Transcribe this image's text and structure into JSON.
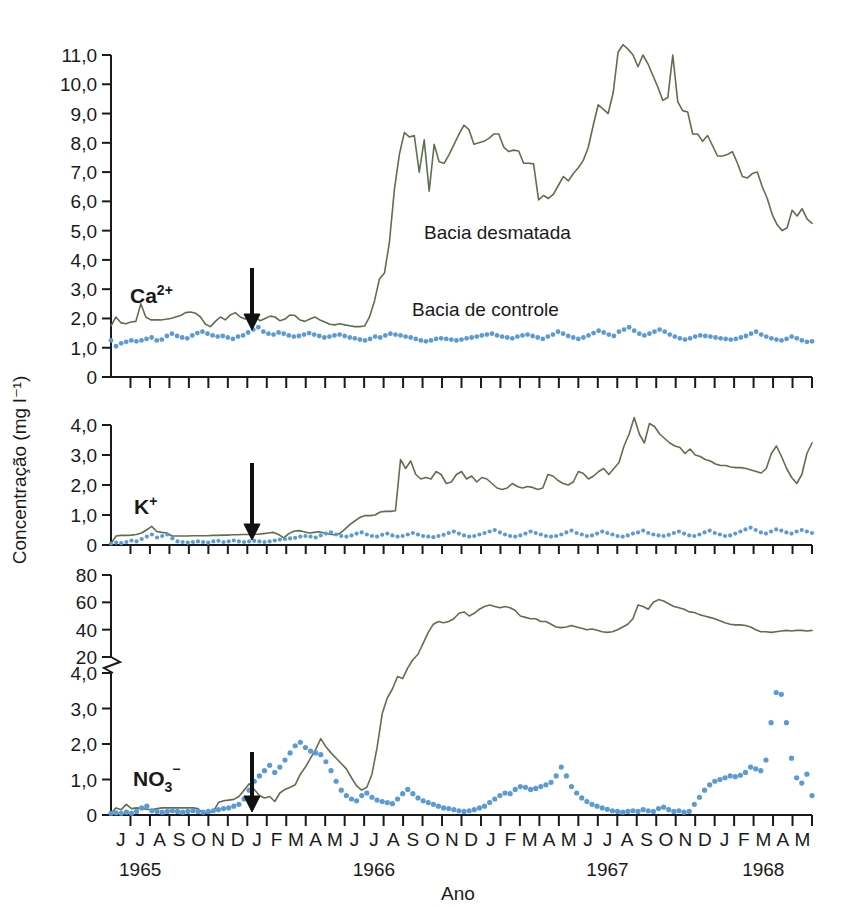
{
  "figure": {
    "y_axis_title": "Concentração (mg l⁻¹)",
    "x_axis_title": "Ano",
    "legend": {
      "treated_label": "Bacia desmatada",
      "control_label": "Bacia de controle"
    },
    "colors": {
      "treated_line": "#5f6f4e",
      "control_dots": "#5b9bd5",
      "axis": "#1a1a1a",
      "arrow": "#111111"
    },
    "months": [
      "J",
      "J",
      "A",
      "S",
      "O",
      "N",
      "D",
      "J",
      "F",
      "M",
      "A",
      "M",
      "J",
      "J",
      "A",
      "S",
      "O",
      "N",
      "D",
      "J",
      "F",
      "M",
      "A",
      "M",
      "J",
      "J",
      "A",
      "S",
      "O",
      "N",
      "D",
      "J",
      "F",
      "M",
      "A",
      "M"
    ],
    "years": [
      {
        "label": "1965",
        "month_index": 1
      },
      {
        "label": "1966",
        "month_index": 13
      },
      {
        "label": "1967",
        "month_index": 25
      },
      {
        "label": "1968",
        "month_index": 33
      }
    ],
    "treatment_arrow_month_index": 8,
    "treatment_arrow_note": "Corte raso / desmatamento"
  },
  "chart_data": [
    {
      "type": "line",
      "title": "Ca2+",
      "panel_label_main": "Ca",
      "panel_label_sup": "2+",
      "ylabel": "Concentração (mg l⁻¹)",
      "xlabel": "Ano",
      "ylim": [
        0,
        11.0
      ],
      "yticks": [
        0,
        1.0,
        2.0,
        3.0,
        4.0,
        5.0,
        6.0,
        7.0,
        8.0,
        9.0,
        10.0,
        11.0
      ],
      "ytick_labels": [
        "0",
        "1,0",
        "2,0",
        "3,0",
        "4,0",
        "5,0",
        "6,0",
        "7,0",
        "8,0",
        "9,0",
        "10,0",
        "11,0"
      ],
      "grid": false,
      "legend_position": "inside-right",
      "series": [
        {
          "name": "Bacia desmatada",
          "style": "solid-line",
          "color": "#5f6f4e",
          "values": [
            1.75,
            2.05,
            1.85,
            1.82,
            1.88,
            1.9,
            2.5,
            2.05,
            1.95,
            1.95,
            1.95,
            1.97,
            2.0,
            2.05,
            2.1,
            2.2,
            2.22,
            2.18,
            2.05,
            1.8,
            1.72,
            1.9,
            2.05,
            1.95,
            2.12,
            2.2,
            2.05,
            1.98,
            2.1,
            2.05,
            1.92,
            2.0,
            2.08,
            2.05,
            1.92,
            1.98,
            2.12,
            2.1,
            1.95,
            1.9,
            1.98,
            2.05,
            1.95,
            1.88,
            1.8,
            1.78,
            1.82,
            1.78,
            1.75,
            1.72,
            1.72,
            1.74,
            2.05,
            2.6,
            3.35,
            3.55,
            4.6,
            6.4,
            7.6,
            8.35,
            8.2,
            8.25,
            7.0,
            8.1,
            6.35,
            7.95,
            7.35,
            7.3,
            7.6,
            7.95,
            8.3,
            8.6,
            8.45,
            7.95,
            8.0,
            8.05,
            8.15,
            8.3,
            8.3,
            7.85,
            7.7,
            7.75,
            7.72,
            7.3,
            7.3,
            7.28,
            6.05,
            6.2,
            6.1,
            6.25,
            6.55,
            6.85,
            6.7,
            6.95,
            7.15,
            7.4,
            7.85,
            8.6,
            9.3,
            9.15,
            9.0,
            9.7,
            11.1,
            11.35,
            11.2,
            11.0,
            10.6,
            11.0,
            10.7,
            10.3,
            9.9,
            9.45,
            9.55,
            11.0,
            9.4,
            9.1,
            9.05,
            8.3,
            8.3,
            8.05,
            8.25,
            7.9,
            7.55,
            7.55,
            7.6,
            7.7,
            7.3,
            6.85,
            6.8,
            6.95,
            7.0,
            6.5,
            6.1,
            5.55,
            5.2,
            5.0,
            5.1,
            5.7,
            5.5,
            5.75,
            5.4,
            5.25
          ]
        },
        {
          "name": "Bacia de controle",
          "style": "dotted",
          "color": "#5b9bd5",
          "values": [
            1.25,
            1.05,
            1.15,
            1.2,
            1.25,
            1.22,
            1.25,
            1.3,
            1.35,
            1.25,
            1.28,
            1.4,
            1.48,
            1.4,
            1.35,
            1.32,
            1.42,
            1.5,
            1.55,
            1.48,
            1.42,
            1.38,
            1.4,
            1.35,
            1.3,
            1.38,
            1.42,
            1.52,
            1.62,
            1.7,
            1.55,
            1.48,
            1.45,
            1.52,
            1.48,
            1.42,
            1.38,
            1.4,
            1.45,
            1.5,
            1.45,
            1.4,
            1.35,
            1.38,
            1.42,
            1.45,
            1.4,
            1.35,
            1.32,
            1.28,
            1.25,
            1.3,
            1.38,
            1.35,
            1.42,
            1.48,
            1.45,
            1.42,
            1.38,
            1.35,
            1.3,
            1.25,
            1.22,
            1.25,
            1.3,
            1.32,
            1.3,
            1.28,
            1.25,
            1.28,
            1.32,
            1.35,
            1.38,
            1.42,
            1.45,
            1.48,
            1.42,
            1.38,
            1.35,
            1.32,
            1.38,
            1.42,
            1.45,
            1.4,
            1.35,
            1.3,
            1.38,
            1.45,
            1.55,
            1.48,
            1.4,
            1.35,
            1.3,
            1.35,
            1.42,
            1.5,
            1.58,
            1.52,
            1.45,
            1.4,
            1.55,
            1.62,
            1.7,
            1.58,
            1.48,
            1.42,
            1.48,
            1.55,
            1.62,
            1.55,
            1.45,
            1.38,
            1.32,
            1.28,
            1.32,
            1.38,
            1.42,
            1.4,
            1.38,
            1.35,
            1.32,
            1.3,
            1.28,
            1.3,
            1.35,
            1.4,
            1.48,
            1.55,
            1.45,
            1.38,
            1.32,
            1.28,
            1.25,
            1.3,
            1.38,
            1.32,
            1.25,
            1.2,
            1.22
          ]
        }
      ]
    },
    {
      "type": "line",
      "title": "K+",
      "panel_label_main": "K",
      "panel_label_sup": "+",
      "ylabel": "Concentração (mg l⁻¹)",
      "xlabel": "Ano",
      "ylim": [
        0,
        4.0
      ],
      "yticks": [
        0,
        1.0,
        2.0,
        3.0,
        4.0
      ],
      "ytick_labels": [
        "0",
        "1,0",
        "2,0",
        "3,0",
        "4,0"
      ],
      "grid": false,
      "series": [
        {
          "name": "Bacia desmatada",
          "style": "solid-line",
          "color": "#5f6f4e",
          "values": [
            0.05,
            0.3,
            0.32,
            0.32,
            0.33,
            0.35,
            0.4,
            0.5,
            0.62,
            0.45,
            0.42,
            0.4,
            0.3,
            0.3,
            0.3,
            0.3,
            0.31,
            0.31,
            0.31,
            0.31,
            0.32,
            0.32,
            0.33,
            0.33,
            0.34,
            0.34,
            0.35,
            0.35,
            0.36,
            0.36,
            0.38,
            0.4,
            0.42,
            0.35,
            0.24,
            0.38,
            0.46,
            0.48,
            0.44,
            0.4,
            0.42,
            0.44,
            0.4,
            0.36,
            0.34,
            0.38,
            0.52,
            0.68,
            0.8,
            0.92,
            0.98,
            0.98,
            1.0,
            1.1,
            1.12,
            1.12,
            1.14,
            2.85,
            2.55,
            2.8,
            2.35,
            2.2,
            2.25,
            2.2,
            2.45,
            2.35,
            2.05,
            2.1,
            2.35,
            2.45,
            2.2,
            2.3,
            2.1,
            2.25,
            2.2,
            2.05,
            1.9,
            1.85,
            1.9,
            2.05,
            1.95,
            1.9,
            1.95,
            1.92,
            1.85,
            1.9,
            2.35,
            2.3,
            2.15,
            2.05,
            2.0,
            2.1,
            2.45,
            2.38,
            2.2,
            2.3,
            2.45,
            2.55,
            2.35,
            2.55,
            2.75,
            3.3,
            3.7,
            4.25,
            3.7,
            3.4,
            4.05,
            3.95,
            3.7,
            3.55,
            3.4,
            3.3,
            3.25,
            3.05,
            3.2,
            3.0,
            2.95,
            2.85,
            2.8,
            2.7,
            2.65,
            2.65,
            2.6,
            2.58,
            2.58,
            2.55,
            2.5,
            2.45,
            2.4,
            2.55,
            3.05,
            3.3,
            2.95,
            2.55,
            2.25,
            2.05,
            2.35,
            3.05,
            3.4
          ]
        },
        {
          "name": "Bacia de controle",
          "style": "dotted",
          "color": "#5b9bd5",
          "values": [
            0.05,
            0.08,
            0.06,
            0.1,
            0.15,
            0.12,
            0.2,
            0.28,
            0.35,
            0.25,
            0.3,
            0.35,
            0.22,
            0.12,
            0.1,
            0.08,
            0.1,
            0.12,
            0.1,
            0.08,
            0.12,
            0.14,
            0.1,
            0.12,
            0.15,
            0.12,
            0.1,
            0.12,
            0.14,
            0.12,
            0.1,
            0.12,
            0.15,
            0.18,
            0.2,
            0.22,
            0.24,
            0.28,
            0.3,
            0.28,
            0.25,
            0.32,
            0.38,
            0.42,
            0.35,
            0.3,
            0.28,
            0.32,
            0.38,
            0.42,
            0.35,
            0.3,
            0.28,
            0.34,
            0.38,
            0.32,
            0.28,
            0.3,
            0.35,
            0.4,
            0.35,
            0.3,
            0.28,
            0.26,
            0.3,
            0.34,
            0.4,
            0.45,
            0.38,
            0.32,
            0.28,
            0.3,
            0.35,
            0.4,
            0.45,
            0.5,
            0.42,
            0.35,
            0.3,
            0.28,
            0.32,
            0.38,
            0.45,
            0.4,
            0.35,
            0.3,
            0.28,
            0.3,
            0.35,
            0.42,
            0.48,
            0.4,
            0.35,
            0.3,
            0.32,
            0.38,
            0.45,
            0.4,
            0.35,
            0.3,
            0.28,
            0.32,
            0.38,
            0.42,
            0.48,
            0.4,
            0.35,
            0.32,
            0.3,
            0.34,
            0.4,
            0.45,
            0.38,
            0.32,
            0.3,
            0.35,
            0.42,
            0.48,
            0.4,
            0.35,
            0.3,
            0.32,
            0.38,
            0.45,
            0.52,
            0.58,
            0.5,
            0.42,
            0.38,
            0.45,
            0.52,
            0.48,
            0.42,
            0.38,
            0.45,
            0.5,
            0.45,
            0.4
          ]
        }
      ]
    },
    {
      "type": "line",
      "title": "NO3-",
      "panel_label_main": "NO",
      "panel_label_sub": "3",
      "panel_label_sup": "−",
      "ylabel": "Concentração (mg l⁻¹)",
      "xlabel": "Ano",
      "axis_break": true,
      "axis_break_between": [
        4.0,
        20
      ],
      "ylim_lower": [
        0,
        4.0
      ],
      "ylim_upper": [
        20,
        80
      ],
      "yticks": [
        0,
        1.0,
        2.0,
        3.0,
        4.0,
        20,
        40,
        60,
        80
      ],
      "ytick_labels": [
        "0",
        "1,0",
        "2,0",
        "3,0",
        "4,0",
        "20",
        "40",
        "60",
        "80"
      ],
      "grid": false,
      "series": [
        {
          "name": "Bacia desmatada",
          "style": "solid-line",
          "color": "#5f6f4e",
          "values": [
            0.05,
            0.2,
            0.15,
            0.3,
            0.18,
            0.2,
            0.18,
            0.16,
            0.15,
            0.18,
            0.2,
            0.2,
            0.2,
            0.2,
            0.2,
            0.2,
            0.2,
            0.18,
            0.05,
            0.05,
            0.1,
            0.35,
            0.4,
            0.42,
            0.44,
            0.52,
            0.7,
            0.88,
            0.72,
            0.55,
            0.48,
            0.52,
            0.38,
            0.62,
            0.72,
            0.78,
            0.85,
            1.15,
            1.35,
            1.6,
            1.85,
            2.15,
            1.92,
            1.75,
            1.6,
            1.45,
            1.3,
            1.05,
            0.82,
            0.7,
            0.78,
            1.15,
            1.9,
            2.85,
            3.3,
            3.55,
            3.9,
            4.2,
            12.0,
            18.0,
            22.0,
            30.0,
            38.0,
            44.0,
            46.0,
            45.0,
            46.0,
            48.0,
            52.0,
            53.0,
            50.0,
            52.0,
            55.0,
            57.0,
            58.0,
            57.0,
            56.0,
            57.0,
            56.0,
            54.0,
            50.0,
            49.0,
            48.0,
            48.0,
            46.0,
            46.0,
            44.0,
            42.0,
            41.5,
            42.0,
            43.0,
            42.0,
            41.0,
            40.0,
            40.5,
            39.5,
            38.5,
            38.0,
            38.5,
            40.0,
            42.0,
            44.0,
            48.0,
            58.0,
            57.0,
            55.0,
            60.0,
            62.0,
            61.0,
            59.0,
            57.0,
            56.0,
            55.0,
            53.0,
            52.5,
            51.0,
            50.0,
            49.0,
            48.0,
            46.5,
            45.0,
            44.0,
            43.5,
            43.5,
            43.0,
            42.0,
            40.0,
            38.5,
            38.5,
            38.0,
            38.5,
            39.0,
            39.5,
            39.0,
            39.5,
            39.5,
            39.0,
            39.5
          ]
        },
        {
          "name": "Bacia de controle",
          "style": "dotted",
          "color": "#5b9bd5",
          "values": [
            0.05,
            0.06,
            0.05,
            0.08,
            0.05,
            0.1,
            0.2,
            0.25,
            0.12,
            0.1,
            0.08,
            0.1,
            0.12,
            0.1,
            0.08,
            0.1,
            0.12,
            0.1,
            0.08,
            0.1,
            0.12,
            0.15,
            0.18,
            0.2,
            0.25,
            0.3,
            0.45,
            0.7,
            0.95,
            1.1,
            1.25,
            1.4,
            1.2,
            1.35,
            1.55,
            1.75,
            1.95,
            2.05,
            1.9,
            1.8,
            1.75,
            1.7,
            1.5,
            1.25,
            0.95,
            0.7,
            0.55,
            0.45,
            0.4,
            0.55,
            0.62,
            0.5,
            0.42,
            0.38,
            0.35,
            0.32,
            0.45,
            0.6,
            0.72,
            0.6,
            0.48,
            0.4,
            0.35,
            0.3,
            0.25,
            0.2,
            0.18,
            0.15,
            0.12,
            0.1,
            0.12,
            0.15,
            0.2,
            0.25,
            0.35,
            0.45,
            0.55,
            0.62,
            0.6,
            0.72,
            0.8,
            0.78,
            0.72,
            0.75,
            0.8,
            0.85,
            0.92,
            1.1,
            1.35,
            1.1,
            0.8,
            0.62,
            0.48,
            0.38,
            0.3,
            0.25,
            0.2,
            0.16,
            0.12,
            0.1,
            0.08,
            0.1,
            0.12,
            0.1,
            0.15,
            0.12,
            0.1,
            0.18,
            0.22,
            0.15,
            0.1,
            0.12,
            0.08,
            0.1,
            0.3,
            0.5,
            0.7,
            0.85,
            0.95,
            1.0,
            1.05,
            1.1,
            1.08,
            1.12,
            1.2,
            1.35,
            1.3,
            1.25,
            1.55,
            2.6,
            3.45,
            3.4,
            2.6,
            1.6,
            1.05,
            0.9,
            1.15,
            0.55
          ]
        }
      ]
    }
  ]
}
